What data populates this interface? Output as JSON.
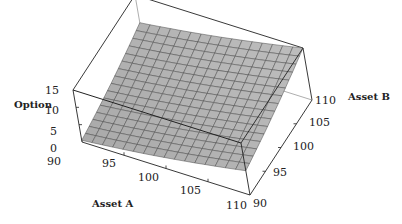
{
  "chart_data": {
    "type": "surface3d",
    "title": "",
    "xlabel": "Asset A",
    "ylabel": "Asset B",
    "zlabel": "Option",
    "x_ticks": [
      "90",
      "95",
      "100",
      "105",
      "110"
    ],
    "y_ticks": [
      "90",
      "95",
      "100",
      "105",
      "110"
    ],
    "z_ticks": [
      "0",
      "5",
      "10",
      "15"
    ],
    "xlim": [
      90,
      110
    ],
    "ylim": [
      90,
      110
    ],
    "zlim": [
      0,
      15
    ],
    "grid_size": 16,
    "surface_color": "#b4b4b4",
    "mesh_color": "#4a4a4a",
    "corner_values": {
      "A90_B90": 0.5,
      "A110_B90": 7,
      "A90_B110": 7,
      "A110_B110": 15
    }
  }
}
